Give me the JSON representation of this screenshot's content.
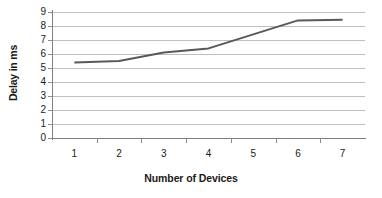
{
  "chart_data": {
    "type": "line",
    "title": "",
    "xlabel": "Number of Devices",
    "ylabel": "Delay in ms",
    "categories": [
      "1",
      "2",
      "3",
      "4",
      "5",
      "6",
      "7"
    ],
    "x": [
      1,
      2,
      3,
      4,
      5,
      6,
      7
    ],
    "values": [
      5.4,
      5.5,
      6.1,
      6.4,
      7.4,
      8.4,
      8.45
    ],
    "series": [
      {
        "name": "Delay",
        "values": [
          5.4,
          5.5,
          6.1,
          6.4,
          7.4,
          8.4,
          8.45
        ]
      }
    ],
    "ylim": [
      0,
      9
    ],
    "ytick_labels": [
      "0",
      "1",
      "2",
      "3",
      "4",
      "5",
      "6",
      "7",
      "8",
      "9"
    ],
    "ytick_values": [
      0,
      1,
      2,
      3,
      4,
      5,
      6,
      7,
      8,
      9
    ],
    "xtick_labels": [
      "1",
      "2",
      "3",
      "4",
      "5",
      "6",
      "7"
    ],
    "grid": "horizontal",
    "legend": "none",
    "line_color": "#595959",
    "gridline_color": "#bfbfbf",
    "axis_color": "#808080",
    "text_color": "#1a1a1a",
    "background_color": "#ffffff"
  }
}
